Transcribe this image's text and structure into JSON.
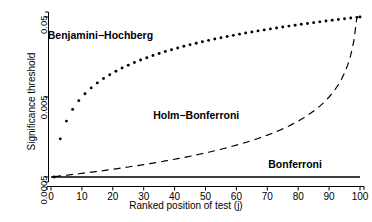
{
  "chart_data": {
    "type": "line",
    "title": "",
    "xlabel": "Ranked position of test (j)",
    "ylabel": "Significance threshold",
    "xlim": [
      0,
      100
    ],
    "ylim": [
      0.0005,
      0.05
    ],
    "yscale": "log",
    "grid": false,
    "legend_position": "in-plot annotations",
    "xticks": [
      "0",
      "10",
      "20",
      "30",
      "40",
      "50",
      "60",
      "70",
      "80",
      "90",
      "100"
    ],
    "xtick_values": [
      0,
      10,
      20,
      30,
      40,
      50,
      60,
      70,
      80,
      90,
      100
    ],
    "yticks": [
      "0.05",
      "0.005",
      "0.0005"
    ],
    "ytick_values": [
      0.05,
      0.005,
      0.0005
    ],
    "alpha": 0.05,
    "m_tests": 100,
    "x": [
      1,
      2,
      3,
      4,
      5,
      6,
      7,
      8,
      9,
      10,
      11,
      12,
      13,
      14,
      15,
      16,
      17,
      18,
      19,
      20,
      21,
      22,
      23,
      24,
      25,
      26,
      27,
      28,
      29,
      30,
      31,
      32,
      33,
      34,
      35,
      36,
      37,
      38,
      39,
      40,
      41,
      42,
      43,
      44,
      45,
      46,
      47,
      48,
      49,
      50,
      51,
      52,
      53,
      54,
      55,
      56,
      57,
      58,
      59,
      60,
      61,
      62,
      63,
      64,
      65,
      66,
      67,
      68,
      69,
      70,
      71,
      72,
      73,
      74,
      75,
      76,
      77,
      78,
      79,
      80,
      81,
      82,
      83,
      84,
      85,
      86,
      87,
      88,
      89,
      90,
      91,
      92,
      93,
      94,
      95,
      96,
      97,
      98,
      99,
      100
    ],
    "series": [
      {
        "name": "Benjamini-Hochberg",
        "label": "Benjamini−Hochberg",
        "style": "dotted",
        "formula": "alpha * j / m",
        "color": "#000000",
        "label_x": 16,
        "label_y": 0.0295,
        "values": [
          0.0005,
          0.001,
          0.0015,
          0.002,
          0.0025,
          0.003,
          0.0035,
          0.004,
          0.0045,
          0.005,
          0.0055,
          0.006,
          0.0065,
          0.007,
          0.0075,
          0.008,
          0.0085,
          0.009,
          0.0095,
          0.01,
          0.0105,
          0.011,
          0.0115,
          0.012,
          0.0125,
          0.013,
          0.0135,
          0.014,
          0.0145,
          0.015,
          0.0155,
          0.016,
          0.0165,
          0.017,
          0.0175,
          0.018,
          0.0185,
          0.019,
          0.0195,
          0.02,
          0.0205,
          0.021,
          0.0215,
          0.022,
          0.0225,
          0.023,
          0.0235,
          0.024,
          0.0245,
          0.025,
          0.0255,
          0.026,
          0.0265,
          0.027,
          0.0275,
          0.028,
          0.0285,
          0.029,
          0.0295,
          0.03,
          0.0305,
          0.031,
          0.0315,
          0.032,
          0.0325,
          0.033,
          0.0335,
          0.034,
          0.0345,
          0.035,
          0.0355,
          0.036,
          0.0365,
          0.037,
          0.0375,
          0.038,
          0.0385,
          0.039,
          0.0395,
          0.04,
          0.0405,
          0.041,
          0.0415,
          0.042,
          0.0425,
          0.043,
          0.0435,
          0.044,
          0.0445,
          0.045,
          0.0455,
          0.046,
          0.0465,
          0.047,
          0.0475,
          0.048,
          0.0485,
          0.049,
          0.0495,
          0.05
        ]
      },
      {
        "name": "Holm-Bonferroni",
        "label": "Holm−Bonferroni",
        "style": "dashed",
        "formula": "alpha / (m - j + 1)",
        "color": "#000000",
        "label_x": 47,
        "label_y": 0.00295,
        "values": [
          0.000505,
          0.00051,
          0.000515,
          0.000521,
          0.000526,
          0.000532,
          0.000538,
          0.000543,
          0.000549,
          0.000556,
          0.000562,
          0.000568,
          0.000575,
          0.000581,
          0.000588,
          0.000595,
          0.000602,
          0.00061,
          0.000617,
          0.000625,
          0.000633,
          0.000641,
          0.000649,
          0.000658,
          0.000667,
          0.000676,
          0.000685,
          0.000694,
          0.000704,
          0.000714,
          0.000725,
          0.000735,
          0.000746,
          0.000758,
          0.000769,
          0.000781,
          0.000794,
          0.000806,
          0.00082,
          0.000833,
          0.000847,
          0.000862,
          0.000877,
          0.000893,
          0.000909,
          0.000926,
          0.000943,
          0.000962,
          0.00098,
          0.001,
          0.00102,
          0.001042,
          0.001064,
          0.001087,
          0.001111,
          0.001136,
          0.001163,
          0.00119,
          0.00122,
          0.00125,
          0.001282,
          0.001316,
          0.001351,
          0.001389,
          0.001429,
          0.001471,
          0.001515,
          0.001563,
          0.001613,
          0.001667,
          0.001724,
          0.001786,
          0.001852,
          0.001923,
          0.002,
          0.002083,
          0.002174,
          0.002273,
          0.002381,
          0.0025,
          0.002632,
          0.002778,
          0.002941,
          0.003125,
          0.003333,
          0.003571,
          0.003846,
          0.004167,
          0.004545,
          0.005,
          0.005556,
          0.00625,
          0.007143,
          0.008333,
          0.01,
          0.0125,
          0.016667,
          0.025,
          0.05,
          0.05
        ]
      },
      {
        "name": "Bonferroni",
        "label": "Bonferroni",
        "style": "solid",
        "formula": "alpha / m",
        "color": "#000000",
        "label_x": 79,
        "label_y": 0.00072,
        "constant_value": 0.0005
      }
    ]
  },
  "axis": {
    "ylabel": "Significance threshold",
    "xlabel": "Ranked position of test (j)"
  }
}
